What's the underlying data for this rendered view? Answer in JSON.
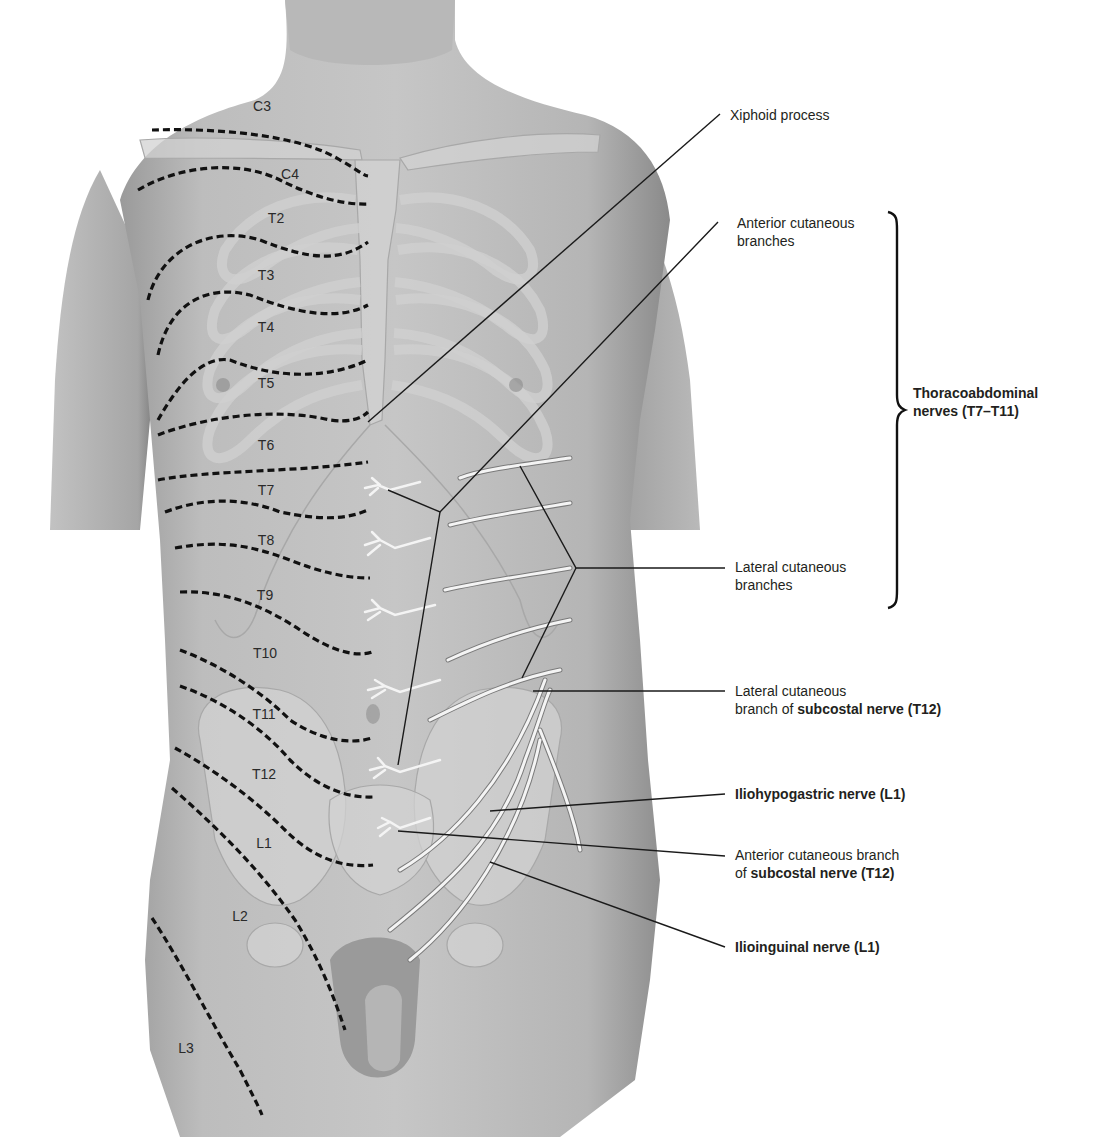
{
  "figure": {
    "colors": {
      "background": "#ffffff",
      "skin": "#bdbdbd",
      "skin_dark": "#8a8a8a",
      "bone": "#d6d6d6",
      "bone_outline": "#a8a8a8",
      "nerve": "#f2f2f2",
      "nerve_outline": "#7a7a7a",
      "dermatome_line": "#111111",
      "leader_line": "#1a1a1a",
      "text": "#231f20"
    }
  },
  "dermatomes": [
    {
      "label": "C3",
      "x": 262,
      "y": 106
    },
    {
      "label": "C4",
      "x": 290,
      "y": 174
    },
    {
      "label": "T2",
      "x": 276,
      "y": 218
    },
    {
      "label": "T3",
      "x": 266,
      "y": 275
    },
    {
      "label": "T4",
      "x": 266,
      "y": 327
    },
    {
      "label": "T5",
      "x": 266,
      "y": 383
    },
    {
      "label": "T6",
      "x": 266,
      "y": 445
    },
    {
      "label": "T7",
      "x": 266,
      "y": 490
    },
    {
      "label": "T8",
      "x": 266,
      "y": 540
    },
    {
      "label": "T9",
      "x": 265,
      "y": 595
    },
    {
      "label": "T10",
      "x": 265,
      "y": 653
    },
    {
      "label": "T11",
      "x": 264,
      "y": 714
    },
    {
      "label": "T12",
      "x": 264,
      "y": 774
    },
    {
      "label": "L1",
      "x": 264,
      "y": 843
    },
    {
      "label": "L2",
      "x": 240,
      "y": 916
    },
    {
      "label": "L3",
      "x": 186,
      "y": 1048
    }
  ],
  "labels": {
    "xiphoid": "Xiphoid process",
    "anterior_cutaneous_l1": "Anterior cutaneous",
    "anterior_cutaneous_l2": "branches",
    "thoraco_l1": "Thoracoabdominal",
    "thoraco_l2": "nerves (T7–T11)",
    "lateral_cutaneous_l1": "Lateral cutaneous",
    "lateral_cutaneous_l2": "branches",
    "lat_subcostal_l1": "Lateral cutaneous",
    "lat_subcostal_l2_prefix": "branch of ",
    "lat_subcostal_l2_bold": "subcostal nerve (T12)",
    "iliohypogastric": "Iliohypogastric nerve (L1)",
    "ant_subcostal_l1": "Anterior cutaneous branch",
    "ant_subcostal_l2_prefix": "of ",
    "ant_subcostal_l2_bold": "subcostal nerve (T12)",
    "ilioinguinal": "Ilioinguinal nerve (L1)"
  }
}
